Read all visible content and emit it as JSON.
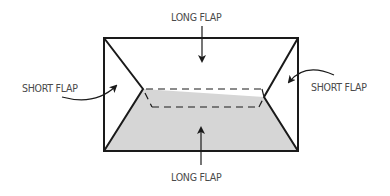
{
  "diagram": {
    "labels": {
      "top": "LONG FLAP",
      "bottom": "LONG FLAP",
      "left": "SHORT FLAP",
      "right": "SHORT FLAP"
    },
    "colors": {
      "stroke": "#1a1a1a",
      "fill_bottom_flap": "#d6d6d6",
      "label": "#4a4a4a",
      "background": "#ffffff"
    },
    "geometry": {
      "envelope_rect": {
        "x": 103,
        "y": 37,
        "width": 196,
        "height": 115
      },
      "left_flap_apex": [
        143,
        89
      ],
      "right_flap_apex": [
        264,
        97
      ],
      "dashed_fold": {
        "top_line": [
          [
            146,
            89
          ],
          [
            261,
            89
          ]
        ],
        "bottom_line": [
          [
            152,
            107
          ],
          [
            259,
            107
          ]
        ]
      }
    },
    "arrows": [
      {
        "name": "top",
        "from": [
          202,
          25
        ],
        "to": [
          202,
          62
        ]
      },
      {
        "name": "bottom",
        "from": [
          201,
          165
        ],
        "to": [
          201,
          127
        ]
      },
      {
        "name": "left",
        "from": [
          62,
          97
        ],
        "to": [
          117,
          84
        ],
        "curved": true
      },
      {
        "name": "right",
        "from": [
          334,
          75
        ],
        "to": [
          288,
          84
        ],
        "curved": true
      }
    ]
  }
}
